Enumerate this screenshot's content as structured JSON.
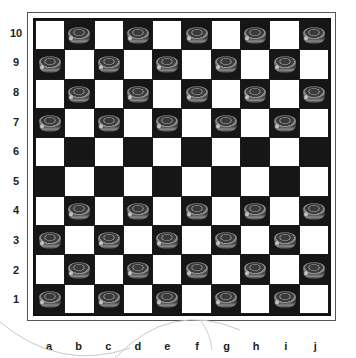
{
  "board": {
    "size": 10,
    "files": [
      "a",
      "b",
      "c",
      "d",
      "e",
      "f",
      "g",
      "h",
      "i",
      "j"
    ],
    "ranks": [
      "10",
      "9",
      "8",
      "7",
      "6",
      "5",
      "4",
      "3",
      "2",
      "1"
    ],
    "colors": {
      "light": "#ffffff",
      "dark": "#161616",
      "frame": "#555555"
    },
    "pieces": {
      "10": [
        "b",
        "d",
        "f",
        "h",
        "j"
      ],
      "9": [
        "a",
        "c",
        "e",
        "g",
        "i"
      ],
      "8": [
        "b",
        "d",
        "f",
        "h",
        "j"
      ],
      "7": [
        "a",
        "c",
        "e",
        "g",
        "i"
      ],
      "6": [],
      "5": [],
      "4": [
        "b",
        "d",
        "f",
        "h",
        "j"
      ],
      "3": [
        "a",
        "c",
        "e",
        "g",
        "i"
      ],
      "2": [
        "b",
        "d",
        "f",
        "h",
        "j"
      ],
      "1": [
        "a",
        "c",
        "e",
        "g",
        "i"
      ]
    },
    "piece_color": "dark"
  }
}
